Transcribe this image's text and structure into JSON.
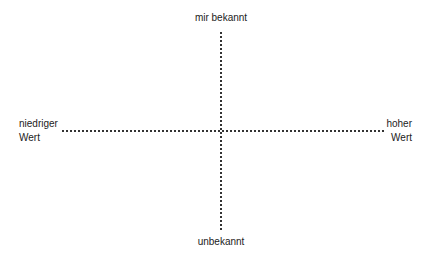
{
  "diagram": {
    "type": "quadrant",
    "axes": {
      "vertical": {
        "top_label": "mir bekannt",
        "bottom_label": "unbekannt"
      },
      "horizontal": {
        "left_label_line1": "niedriger",
        "left_label_line2": "Wert",
        "right_label_line1": "hoher",
        "right_label_line2": "Wert"
      }
    },
    "line_style": "dotted",
    "line_color": "#333333",
    "text_color": "#222222",
    "background": "#ffffff"
  }
}
